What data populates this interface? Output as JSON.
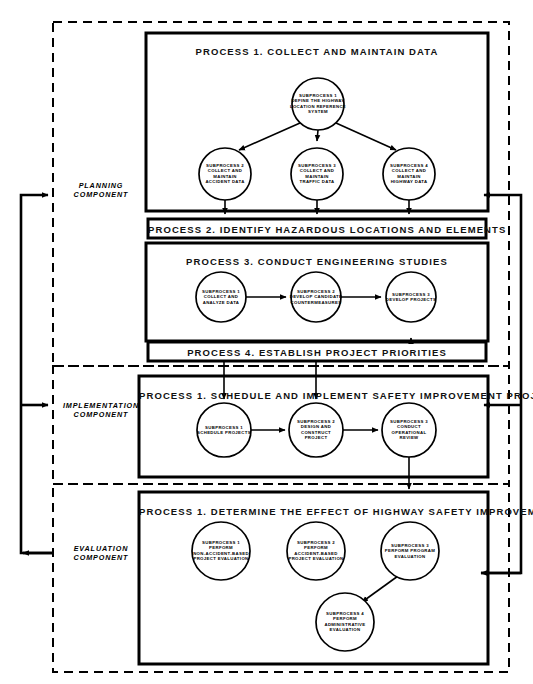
{
  "diagram": {
    "components": [
      {
        "id": "planning",
        "label": "PLANNING\nCOMPONENT",
        "cx": 101,
        "cy": 190
      },
      {
        "id": "implementation",
        "label": "IMPLEMENTATION\nCOMPONENT",
        "cx": 101,
        "cy": 410
      },
      {
        "id": "evaluation",
        "label": "EVALUATION\nCOMPONENT",
        "cx": 101,
        "cy": 553
      }
    ],
    "panels": [
      {
        "id": "process-1-collect",
        "title": "PROCESS 1.   COLLECT AND MAINTAIN DATA",
        "x": 146,
        "y": 33,
        "w": 342,
        "h": 178,
        "title_y": 46
      },
      {
        "id": "process-3-studies",
        "title": "PROCESS 3.   CONDUCT ENGINEERING STUDIES",
        "x": 146,
        "y": 243,
        "w": 342,
        "h": 98,
        "title_y": 256
      },
      {
        "id": "process-1-schedule",
        "title": "PROCESS 1.   SCHEDULE AND IMPLEMENT SAFETY IMPROVEMENT PROJECTS",
        "x": 139,
        "y": 376,
        "w": 349,
        "h": 101,
        "title_y": 390
      },
      {
        "id": "process-1-determine",
        "title": "PROCESS 1.   DETERMINE THE EFFECT OF HIGHWAY SAFETY IMPROVEMENTS",
        "x": 139,
        "y": 492,
        "w": 349,
        "h": 172,
        "title_y": 506
      }
    ],
    "bars": [
      {
        "id": "process-2-bar",
        "title": "PROCESS 2.   IDENTIFY HAZARDOUS LOCATIONS AND ELEMENTS",
        "x": 148,
        "y": 219,
        "w": 338,
        "h": 19
      },
      {
        "id": "process-4-bar",
        "title": "PROCESS 4.   ESTABLISH PROJECT PRIORITIES",
        "x": 148,
        "y": 342,
        "w": 338,
        "h": 19
      }
    ],
    "nodes": [
      {
        "id": "p1-sub1",
        "label": "SUBPROCESS 1\nDEFINE THE HIGHWAY\nLOCATION REFERENCE\nSYSTEM",
        "cx": 318,
        "cy": 104,
        "r": 26
      },
      {
        "id": "p1-sub2",
        "label": "SUBPROCESS 2\nCOLLECT AND MAINTAIN\nACCIDENT DATA",
        "cx": 225,
        "cy": 174,
        "r": 26
      },
      {
        "id": "p1-sub3",
        "label": "SUBPROCESS 3\nCOLLECT AND MAINTAIN\nTRAFFIC DATA",
        "cx": 317,
        "cy": 174,
        "r": 26
      },
      {
        "id": "p1-sub4",
        "label": "SUBPROCESS 4\nCOLLECT AND MAINTAIN\nHIGHWAY DATA",
        "cx": 409,
        "cy": 174,
        "r": 26
      },
      {
        "id": "p3-sub1",
        "label": "SUBPROCESS 1\nCOLLECT AND\nANALYZE DATA",
        "cx": 221,
        "cy": 297,
        "r": 25
      },
      {
        "id": "p3-sub2",
        "label": "SUBPROCESS 2\nDEVELOP CANDIDATE\nCOUNTERMEASURES",
        "cx": 316,
        "cy": 297,
        "r": 25
      },
      {
        "id": "p3-sub3",
        "label": "SUBPROCESS 3\nDEVELOP PROJECTS",
        "cx": 411,
        "cy": 297,
        "r": 25
      },
      {
        "id": "im-sub1",
        "label": "SUBPROCESS 1\nSCHEDULE PROJECTS",
        "cx": 224,
        "cy": 430,
        "r": 27
      },
      {
        "id": "im-sub2",
        "label": "SUBPROCESS 2\nDESIGN AND\nCONSTRUCT\nPROJECT",
        "cx": 316,
        "cy": 430,
        "r": 27
      },
      {
        "id": "im-sub3",
        "label": "SUBPROCESS 3\nCONDUCT\nOPERATIONAL\nREVIEW",
        "cx": 409,
        "cy": 430,
        "r": 27
      },
      {
        "id": "ev-sub1",
        "label": "SUBPROCESS 1\nPERFORM\nNON-ACCIDENT-BASED\nPROJECT EVALUATION",
        "cx": 221,
        "cy": 551,
        "r": 29
      },
      {
        "id": "ev-sub2",
        "label": "SUBPROCESS 2\nPERFORM\nACCIDENT-BASED\nPROJECT EVALUATION",
        "cx": 316,
        "cy": 551,
        "r": 29
      },
      {
        "id": "ev-sub3",
        "label": "SUBPROCESS 3\nPERFORM PROGRAM\nEVALUATION",
        "cx": 410,
        "cy": 551,
        "r": 29
      },
      {
        "id": "ev-sub4",
        "label": "SUBPROCESS 4\nPERFORM\nADMINISTRATIVE\nEVALUATION",
        "cx": 345,
        "cy": 622,
        "r": 29
      }
    ],
    "colors": {
      "ink": "#000000",
      "paper": "#ffffff"
    }
  }
}
